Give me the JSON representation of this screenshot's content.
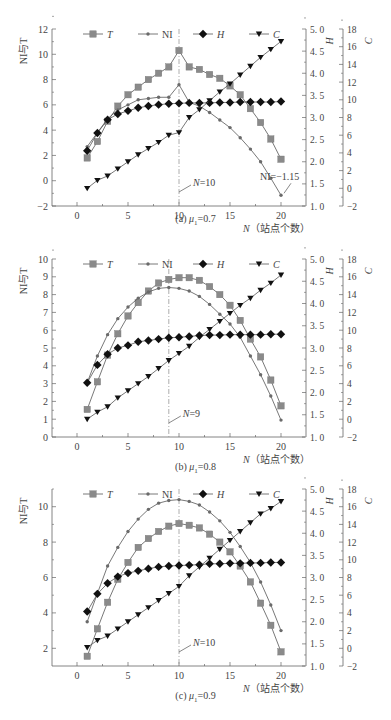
{
  "chart_data": [
    {
      "type": "line",
      "panel": "a",
      "caption": "(a) μ₁=0.7",
      "caption_prefix": "(a)",
      "caption_mu": "μ",
      "caption_sub": "1",
      "caption_value": "=0.7",
      "xlabel": "N（站点个数）",
      "xlabel_var": "N",
      "xlabel_text": "（站点个数）",
      "ylabel_left": "NI与T",
      "ylabel_right1": "H",
      "ylabel_right2": "C",
      "xlim": [
        -2.5,
        22.5
      ],
      "xticks": [
        0,
        5,
        10,
        15,
        20
      ],
      "ylim_left": [
        -2,
        12
      ],
      "yticks_left": [
        -2,
        0,
        2,
        4,
        6,
        8,
        10,
        12
      ],
      "ylim_H": [
        1.0,
        5.0
      ],
      "yticks_H": [
        "1.0",
        "1.5",
        "2.0",
        "2.5",
        "3.0",
        "3.5",
        "4.0",
        "4.5",
        "5.0"
      ],
      "ylim_C": [
        -2,
        18
      ],
      "yticks_C": [
        -2,
        0,
        2,
        4,
        6,
        8,
        10,
        12,
        14,
        16,
        18
      ],
      "vline_x": 10,
      "annotations": [
        {
          "text": "N=10",
          "x": 10,
          "anchor": "vline"
        },
        {
          "text": "NI=−1.15",
          "x": 20,
          "y": -1.15
        }
      ],
      "legend": [
        "T",
        "NI",
        "H",
        "C"
      ],
      "x": [
        1,
        2,
        3,
        4,
        5,
        6,
        7,
        8,
        9,
        10,
        11,
        12,
        13,
        14,
        15,
        16,
        17,
        18,
        19,
        20
      ],
      "series": [
        {
          "name": "T",
          "axis": "left",
          "marker": "square",
          "values": [
            1.8,
            3.1,
            4.7,
            5.9,
            6.8,
            7.4,
            8.0,
            8.5,
            9.0,
            10.3,
            9.0,
            8.8,
            8.4,
            8.1,
            7.5,
            6.8,
            5.7,
            4.6,
            3.3,
            1.7
          ]
        },
        {
          "name": "NI",
          "axis": "left",
          "marker": "star",
          "values": [
            2.7,
            3.8,
            4.9,
            5.6,
            6.0,
            6.4,
            6.5,
            6.6,
            6.6,
            7.6,
            6.2,
            5.9,
            5.4,
            4.8,
            4.2,
            3.4,
            2.5,
            1.5,
            0.2,
            -1.15
          ]
        },
        {
          "name": "H",
          "axis": "H",
          "marker": "diamond",
          "values": [
            2.25,
            2.65,
            2.95,
            3.08,
            3.15,
            3.22,
            3.26,
            3.29,
            3.31,
            3.32,
            3.33,
            3.33,
            3.33,
            3.34,
            3.34,
            3.35,
            3.35,
            3.35,
            3.35,
            3.36
          ]
        },
        {
          "name": "C",
          "axis": "C",
          "marker": "triangle-down",
          "values": [
            0.0,
            0.9,
            1.4,
            2.2,
            3.0,
            3.8,
            4.5,
            5.2,
            6.0,
            6.3,
            8.0,
            8.9,
            9.9,
            10.9,
            11.8,
            12.8,
            13.8,
            14.8,
            15.7,
            16.6
          ]
        }
      ]
    },
    {
      "type": "line",
      "panel": "b",
      "caption": "(b) μ₁=0.8",
      "caption_prefix": "(b)",
      "caption_mu": "μ",
      "caption_sub": "1",
      "caption_value": "=0.8",
      "xlabel": "N（站点个数）",
      "xlabel_var": "N",
      "xlabel_text": "（站点个数）",
      "ylabel_left": "NI与T",
      "ylabel_right1": "H",
      "ylabel_right2": "C",
      "xlim": [
        -2.5,
        22.5
      ],
      "xticks": [
        0,
        5,
        10,
        15,
        20
      ],
      "ylim_left": [
        0,
        10
      ],
      "yticks_left": [
        0,
        1,
        2,
        3,
        4,
        5,
        6,
        7,
        8,
        9,
        10
      ],
      "ylim_H": [
        1.0,
        5.0
      ],
      "yticks_H": [
        "1.0",
        "1.5",
        "2.0",
        "2.5",
        "3.0",
        "3.5",
        "4.0",
        "4.5",
        "5.0"
      ],
      "ylim_C": [
        -2,
        18
      ],
      "yticks_C": [
        -2,
        0,
        2,
        4,
        6,
        8,
        10,
        12,
        14,
        16,
        18
      ],
      "vline_x": 9,
      "annotations": [
        {
          "text": "N=9",
          "x": 9,
          "anchor": "vline"
        }
      ],
      "legend": [
        "T",
        "NI",
        "H",
        "C"
      ],
      "x": [
        1,
        2,
        3,
        4,
        5,
        6,
        7,
        8,
        9,
        10,
        11,
        12,
        13,
        14,
        15,
        16,
        17,
        18,
        19,
        20
      ],
      "series": [
        {
          "name": "T",
          "axis": "left",
          "marker": "square",
          "values": [
            1.55,
            3.1,
            4.6,
            5.8,
            6.8,
            7.55,
            8.2,
            8.65,
            8.85,
            8.95,
            8.95,
            8.8,
            8.45,
            8.0,
            7.4,
            6.55,
            5.5,
            4.5,
            3.2,
            1.75
          ]
        },
        {
          "name": "NI",
          "axis": "left",
          "marker": "star",
          "values": [
            3.05,
            4.55,
            5.75,
            6.65,
            7.3,
            7.8,
            8.15,
            8.35,
            8.4,
            8.35,
            8.2,
            7.9,
            7.45,
            6.9,
            6.35,
            5.6,
            4.55,
            3.5,
            2.3,
            0.95
          ]
        },
        {
          "name": "H",
          "axis": "H",
          "marker": "diamond",
          "values": [
            2.22,
            2.62,
            2.86,
            3.0,
            3.06,
            3.14,
            3.17,
            3.2,
            3.23,
            3.24,
            3.26,
            3.28,
            3.29,
            3.29,
            3.3,
            3.3,
            3.3,
            3.3,
            3.31,
            3.31
          ]
        },
        {
          "name": "C",
          "axis": "C",
          "marker": "triangle-down",
          "values": [
            0.0,
            0.8,
            1.4,
            2.4,
            3.2,
            4.0,
            4.8,
            5.7,
            6.6,
            7.4,
            8.2,
            9.2,
            10.1,
            11.0,
            11.9,
            12.8,
            13.6,
            14.5,
            15.3,
            16.2
          ]
        }
      ]
    },
    {
      "type": "line",
      "panel": "c",
      "caption": "(c) μ₁=0.9",
      "caption_prefix": "(c)",
      "caption_mu": "μ",
      "caption_sub": "1",
      "caption_value": "=0.9",
      "xlabel": "N（站点个数）",
      "xlabel_var": "N",
      "xlabel_text": "（站点个数）",
      "ylabel_left": "NI与T",
      "ylabel_right1": "H",
      "ylabel_right2": "C",
      "xlim": [
        -2.5,
        22.5
      ],
      "xticks": [
        0,
        5,
        10,
        15,
        20
      ],
      "ylim_left": [
        1,
        11
      ],
      "yticks_left": [
        2,
        4,
        6,
        8,
        10
      ],
      "ylim_H": [
        1.0,
        5.0
      ],
      "yticks_H": [
        "1.0",
        "1.5",
        "2.0",
        "2.5",
        "3.0",
        "3.5",
        "4.0",
        "4.5",
        "5.0"
      ],
      "ylim_C": [
        -2,
        18
      ],
      "yticks_C": [
        -2,
        0,
        2,
        4,
        6,
        8,
        10,
        12,
        14,
        16,
        18
      ],
      "vline_x": 10,
      "annotations": [
        {
          "text": "N=10",
          "x": 10,
          "anchor": "vline"
        }
      ],
      "legend": [
        "T",
        "NI",
        "H",
        "C"
      ],
      "x": [
        1,
        2,
        3,
        4,
        5,
        6,
        7,
        8,
        9,
        10,
        11,
        12,
        13,
        14,
        15,
        16,
        17,
        18,
        19,
        20
      ],
      "series": [
        {
          "name": "T",
          "axis": "left",
          "marker": "square",
          "values": [
            1.55,
            3.1,
            4.6,
            5.9,
            6.85,
            7.7,
            8.2,
            8.6,
            8.9,
            9.05,
            8.95,
            8.8,
            8.45,
            8.0,
            7.45,
            6.65,
            5.75,
            4.55,
            3.3,
            1.8
          ]
        },
        {
          "name": "NI",
          "axis": "left",
          "marker": "star",
          "values": [
            3.5,
            5.1,
            6.65,
            7.7,
            8.6,
            9.3,
            9.85,
            10.2,
            10.35,
            10.4,
            10.3,
            10.1,
            9.7,
            9.2,
            8.55,
            7.75,
            6.85,
            5.75,
            4.45,
            3.0
          ]
        },
        {
          "name": "H",
          "axis": "H",
          "marker": "diamond",
          "values": [
            2.23,
            2.63,
            2.87,
            3.02,
            3.1,
            3.15,
            3.2,
            3.24,
            3.26,
            3.27,
            3.28,
            3.29,
            3.31,
            3.31,
            3.32,
            3.32,
            3.33,
            3.33,
            3.34,
            3.34
          ]
        },
        {
          "name": "C",
          "axis": "C",
          "marker": "triangle-down",
          "values": [
            0.1,
            0.9,
            1.4,
            2.2,
            3.0,
            3.8,
            4.6,
            5.4,
            6.2,
            7.0,
            8.2,
            9.2,
            10.2,
            11.2,
            12.2,
            13.2,
            14.2,
            15.2,
            15.8,
            16.6
          ]
        }
      ]
    }
  ],
  "style": {
    "T_color": "#8a8a8a",
    "NI_color": "#6a6a6a",
    "H_color": "#111111",
    "C_color": "#111111",
    "line_color": "#555555",
    "axis_color": "#666666",
    "vline_color": "#999999"
  }
}
